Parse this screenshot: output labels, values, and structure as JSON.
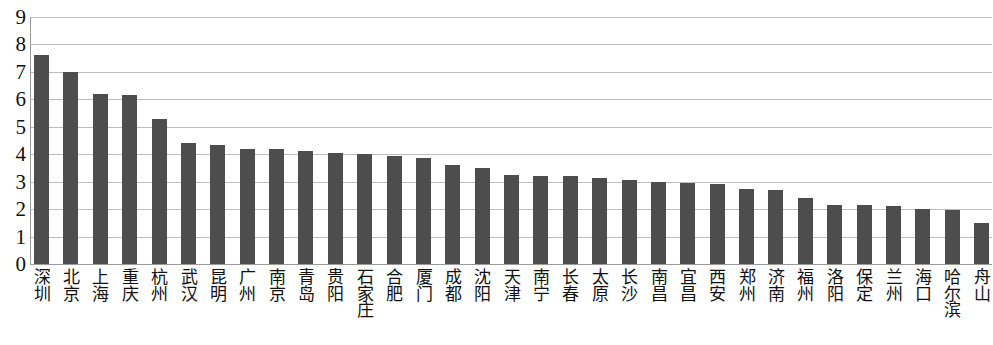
{
  "chart_data": {
    "type": "bar",
    "title": "",
    "subtitle": "",
    "xlabel": "",
    "ylabel": "",
    "ylim": [
      0,
      9
    ],
    "yticks": [
      "0",
      "1",
      "2",
      "3",
      "4",
      "5",
      "6",
      "7",
      "8",
      "9"
    ],
    "grid": true,
    "legend": null,
    "bar_color": "#4d4d4d",
    "gridline_color": "#bdbdbd",
    "axis_color": "#9a9a9a",
    "categories": [
      "深圳",
      "北京",
      "上海",
      "重庆",
      "杭州",
      "武汉",
      "昆明",
      "广州",
      "南京",
      "青岛",
      "贵阳",
      "石家庄",
      "合肥",
      "厦门",
      "成都",
      "沈阳",
      "天津",
      "南宁",
      "长春",
      "太原",
      "长沙",
      "南昌",
      "宜昌",
      "西安",
      "郑州",
      "济南",
      "福州",
      "洛阳",
      "保定",
      "兰州",
      "海口",
      "哈尔滨",
      "舟山"
    ],
    "values": [
      7.6,
      7.0,
      6.2,
      6.15,
      5.3,
      4.4,
      4.35,
      4.2,
      4.2,
      4.1,
      4.05,
      4.0,
      3.95,
      3.85,
      3.6,
      3.5,
      3.25,
      3.2,
      3.2,
      3.15,
      3.05,
      3.0,
      2.95,
      2.9,
      2.75,
      2.7,
      2.4,
      2.15,
      2.15,
      2.1,
      2.0,
      1.95,
      1.5
    ]
  }
}
